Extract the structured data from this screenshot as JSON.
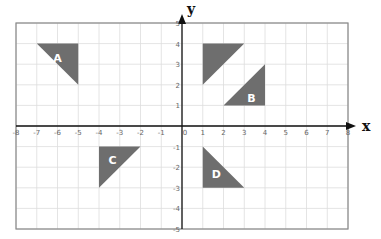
{
  "axes": {
    "x_label": "x",
    "y_label": "y",
    "x_range": [
      -8,
      8
    ],
    "y_range": [
      -5,
      5
    ],
    "x_ticks": [
      "-8",
      "-7",
      "-6",
      "-5",
      "-4",
      "-3",
      "-2",
      "-1",
      "0",
      "1",
      "2",
      "3",
      "4",
      "5",
      "6",
      "7",
      "8"
    ],
    "y_ticks": [
      "5",
      "4",
      "3",
      "2",
      "1",
      "-1",
      "-2",
      "-3",
      "-4",
      "-5"
    ]
  },
  "colors": {
    "shape_fill": "#6e6e6e",
    "grid": "#dddddd",
    "border": "#888888",
    "axis": "#111111"
  },
  "shapes": [
    {
      "label": "A",
      "vertices": [
        [
          -7,
          4
        ],
        [
          -5,
          4
        ],
        [
          -5,
          2
        ]
      ],
      "label_pos": [
        -6,
        3.3
      ]
    },
    {
      "label": "",
      "vertices": [
        [
          1,
          4
        ],
        [
          3,
          4
        ],
        [
          1,
          2
        ]
      ],
      "label_pos": [
        1.6,
        3.3
      ]
    },
    {
      "label": "B",
      "vertices": [
        [
          4,
          3
        ],
        [
          4,
          1
        ],
        [
          2,
          1
        ]
      ],
      "label_pos": [
        3.35,
        1.35
      ]
    },
    {
      "label": "C",
      "vertices": [
        [
          -4,
          -1
        ],
        [
          -2,
          -1
        ],
        [
          -4,
          -3
        ]
      ],
      "label_pos": [
        -3.35,
        -1.65
      ]
    },
    {
      "label": "D",
      "vertices": [
        [
          1,
          -1
        ],
        [
          1,
          -3
        ],
        [
          3,
          -3
        ]
      ],
      "label_pos": [
        1.65,
        -2.35
      ]
    }
  ]
}
